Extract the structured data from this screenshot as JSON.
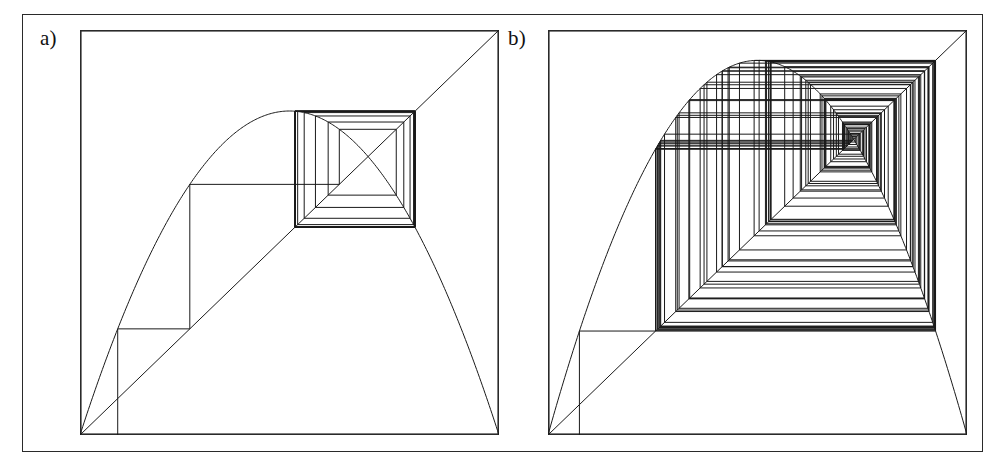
{
  "figure": {
    "kind": "cobweb-diagram-pair",
    "background_color": "#ffffff",
    "line_color": "#1a1a1a",
    "frame_color": "#2a2a2a",
    "outer_frame": {
      "x": 22,
      "y": 14,
      "width": 961,
      "height": 438
    }
  },
  "panels": [
    {
      "id": "a",
      "label": "a)",
      "box": {
        "x": 80,
        "y": 30,
        "width": 419,
        "height": 405
      },
      "description": "cobweb plot spiralling inward to a stable fixed point"
    },
    {
      "id": "b",
      "label": "b)",
      "box": {
        "x": 548,
        "y": 30,
        "width": 419,
        "height": 405
      },
      "description": "cobweb plot with a dense chaotic orbit filling the square"
    }
  ],
  "chart_data": [
    {
      "type": "line",
      "subplot": "a",
      "title": "",
      "xlabel": "",
      "ylabel": "",
      "xlim": [
        0,
        1
      ],
      "ylim": [
        0,
        1
      ],
      "grid": false,
      "legend": "none",
      "map": {
        "name": "logistic",
        "formula": "f(x) = r*x*(1-x)",
        "r": 3.2
      },
      "series": [
        {
          "name": "map-curve",
          "role": "f(x)",
          "r": 3.2,
          "samples": 300
        },
        {
          "name": "identity-line",
          "role": "y = x",
          "points": [
            [
              0,
              0
            ],
            [
              1,
              1
            ]
          ]
        },
        {
          "name": "cobweb-orbit",
          "role": "iteration",
          "x0": 0.09,
          "iterations": 26
        }
      ],
      "fixed_point": {
        "x": 0.6875,
        "y": 0.6875
      }
    },
    {
      "type": "line",
      "subplot": "b",
      "title": "",
      "xlabel": "",
      "ylabel": "",
      "xlim": [
        0,
        1
      ],
      "ylim": [
        0,
        1
      ],
      "grid": false,
      "legend": "none",
      "map": {
        "name": "logistic",
        "formula": "f(x) = r*x*(1-x)",
        "r": 3.7
      },
      "series": [
        {
          "name": "map-curve",
          "role": "f(x)",
          "r": 3.7,
          "samples": 300
        },
        {
          "name": "identity-line",
          "role": "y = x",
          "points": [
            [
              0,
              0
            ],
            [
              1,
              1
            ]
          ]
        },
        {
          "name": "cobweb-orbit",
          "role": "iteration",
          "x0": 0.075,
          "iterations": 120
        }
      ],
      "fixed_point": {
        "x": 0.72973,
        "y": 0.72973
      }
    }
  ]
}
